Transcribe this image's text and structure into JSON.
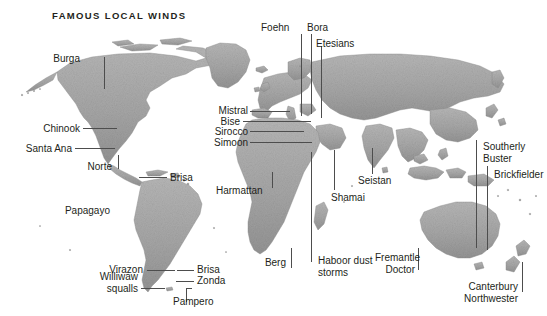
{
  "figure": {
    "title": "FAMOUS LOCAL WINDS",
    "kind": "world-map-illustration",
    "background_color": "#ffffff",
    "land_color": "#a9a9a9",
    "land_shadow_color": "#7d7d7d",
    "label_color": "#231f20",
    "leader_line_color": "#4d4d4d"
  },
  "labels": {
    "burga": "Burga",
    "chinook": "Chinook",
    "santa_ana": "Santa Ana",
    "norte": "Norte",
    "papagayo": "Papagayo",
    "brisa_north": "Brisa",
    "virazon": "Virazon",
    "brisa_south": "Brisa",
    "zonda": "Zonda",
    "williwaw": "Williwaw\nsqualls",
    "williwaw_line1": "Williwaw",
    "williwaw_line2": "squalls",
    "pampero": "Pampero",
    "foehn": "Foehn",
    "bora": "Bora",
    "etesians": "Etesians",
    "mistral": "Mistral",
    "bise": "Bise",
    "sirocco": "Sirocco",
    "simoon": "Simoon",
    "harmattan": "Harmattan",
    "berg": "Berg",
    "haboor_line1": "Haboor dust",
    "haboor_line2": "storms",
    "shamai": "Shamai",
    "seistan": "Seistan",
    "fremantle_line1": "Fremantle",
    "fremantle_line2": "Doctor",
    "southerly_line1": "Southerly",
    "southerly_line2": "Buster",
    "brickfielder": "Brickfielder",
    "canterbury_line1": "Canterbury",
    "canterbury_line2": "Northwester"
  }
}
